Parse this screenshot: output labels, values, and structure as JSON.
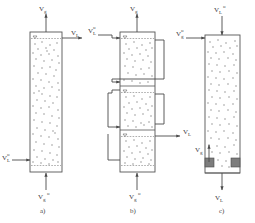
{
  "figure": {
    "background_color": "#ffffff",
    "line_color": "#4a4a4a",
    "bubble_color": "#8e8e8e",
    "block_color": "#7d7d7d"
  },
  "panels": [
    {
      "id": "a",
      "caption": "a)",
      "description": "Single-stage countercurrent bubble column",
      "vessel": {
        "x": 30,
        "y": 32,
        "width": 32,
        "height": 140
      },
      "stages": 1,
      "streams": [
        {
          "name": "gas-outlet-top",
          "symbol": "V",
          "subscript": "g",
          "superscript": "",
          "label": "Vg",
          "direction": "up",
          "position": "top"
        },
        {
          "name": "liquid-outlet-right",
          "symbol": "V",
          "subscript": "L",
          "superscript": "",
          "label": "VL",
          "direction": "right",
          "position": "top-right"
        },
        {
          "name": "liquid-inlet-left",
          "symbol": "V",
          "subscript": "L",
          "superscript": "o",
          "label": "VL°",
          "direction": "right",
          "position": "bottom-left"
        },
        {
          "name": "gas-inlet-bottom",
          "symbol": "V",
          "subscript": "g",
          "superscript": "o",
          "label": "Vg°",
          "direction": "up",
          "position": "bottom"
        }
      ]
    },
    {
      "id": "b",
      "caption": "b)",
      "description": "Three-stage column with external liquid recirculation loops",
      "vessel": {
        "x": 120,
        "y": 32,
        "width": 35,
        "height": 140
      },
      "stages": 3,
      "stage_dividers_y": [
        86,
        130
      ],
      "streams": [
        {
          "name": "gas-outlet-top",
          "symbol": "V",
          "subscript": "g",
          "superscript": "",
          "label": "Vg",
          "direction": "up",
          "position": "top"
        },
        {
          "name": "liquid-inlet-left",
          "symbol": "V",
          "subscript": "L",
          "superscript": "o",
          "label": "VL°",
          "direction": "right",
          "position": "top-left"
        },
        {
          "name": "liquid-outlet-right",
          "symbol": "V",
          "subscript": "L",
          "superscript": "",
          "label": "VL",
          "direction": "right",
          "position": "mid-right"
        },
        {
          "name": "gas-inlet-bottom",
          "symbol": "V",
          "subscript": "g",
          "superscript": "o",
          "label": "Vg°",
          "direction": "up",
          "position": "bottom"
        }
      ]
    },
    {
      "id": "c",
      "caption": "c)",
      "description": "Cocurrent downflow bubble column",
      "vessel": {
        "x": 205,
        "y": 35,
        "width": 35,
        "height": 138
      },
      "stages": 1,
      "streams": [
        {
          "name": "liquid-inlet-top",
          "symbol": "V",
          "subscript": "L",
          "superscript": "o",
          "label": "VL°",
          "direction": "down",
          "position": "top"
        },
        {
          "name": "gas-inlet-left",
          "symbol": "V",
          "subscript": "g",
          "superscript": "o",
          "label": "Vg°",
          "direction": "right",
          "position": "top-left"
        },
        {
          "name": "gas-outlet-left",
          "symbol": "V",
          "subscript": "g",
          "superscript": "",
          "label": "Vg",
          "direction": "up",
          "position": "bottom-left"
        },
        {
          "name": "liquid-outlet-bottom",
          "symbol": "V",
          "subscript": "L",
          "superscript": "",
          "label": "VL",
          "direction": "down",
          "position": "bottom"
        }
      ]
    }
  ],
  "labels": {
    "V": "V",
    "g": "g",
    "L": "L",
    "deg": "o",
    "caption_a": "a)",
    "caption_b": "b)",
    "caption_c": "c)"
  }
}
